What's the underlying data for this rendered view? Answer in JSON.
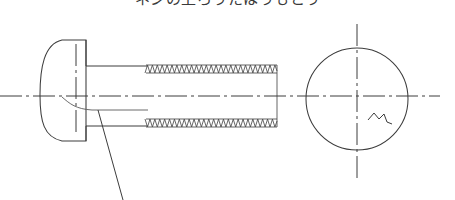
{
  "drawing": {
    "title_clipped": "ネジの上ろうたはうもとう",
    "title_note": "top title row clipped by image edge",
    "background_color": "#ffffff",
    "line_color": "#3c3c3c",
    "thread_line_color": "#4a4a4a",
    "views": {
      "side_view": {
        "name": "side-view-bolt",
        "head": {
          "name": "dome-head",
          "type": "round/dome head",
          "left_x": 40,
          "right_x": 86,
          "top_y": 40,
          "bottom_y": 141,
          "center_y": 95
        },
        "shank_plain": {
          "name": "plain-shank",
          "start_x": 86,
          "end_x": 146,
          "top_y": 66,
          "bottom_y": 126
        },
        "threaded_shank": {
          "name": "threaded-shank",
          "start_x": 146,
          "end_x": 277,
          "crest_top_y": 65,
          "crest_bottom_y": 127,
          "root_top_y": 73,
          "root_bottom_y": 119,
          "thread_count": 27
        },
        "fillet": {
          "name": "head-fillet-curve",
          "from_x": 62,
          "from_y": 97,
          "to_x": 86,
          "to_y": 110
        }
      },
      "end_view": {
        "name": "end-view-circle",
        "center_x": 357,
        "center_y": 99,
        "radius": 51,
        "break_mark": {
          "name": "break-squiggle",
          "description": "small zigzag break line in lower-right quadrant"
        }
      }
    },
    "centerlines": {
      "horizontal_main": {
        "name": "horizontal-centerline",
        "x1": 0,
        "x2": 440,
        "y": 96
      },
      "vertical_head": {
        "name": "head-vertical-centerline",
        "x": 76,
        "y1": 44,
        "y2": 133
      },
      "vertical_circle": {
        "name": "circle-vertical-centerline",
        "x": 357,
        "y1": 24,
        "y2": 178
      }
    },
    "leader_line": {
      "name": "leader-line",
      "from_x": 98,
      "from_y": 110,
      "to_x": 123,
      "to_y": 200,
      "label": ""
    }
  }
}
